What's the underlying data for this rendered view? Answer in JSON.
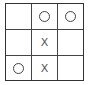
{
  "game": "tic-tac-toe",
  "board": [
    [
      "",
      "O",
      "O"
    ],
    [
      "",
      "X",
      ""
    ],
    [
      "O",
      "X",
      ""
    ]
  ],
  "symbols": {
    "x": "X",
    "o": "O"
  }
}
